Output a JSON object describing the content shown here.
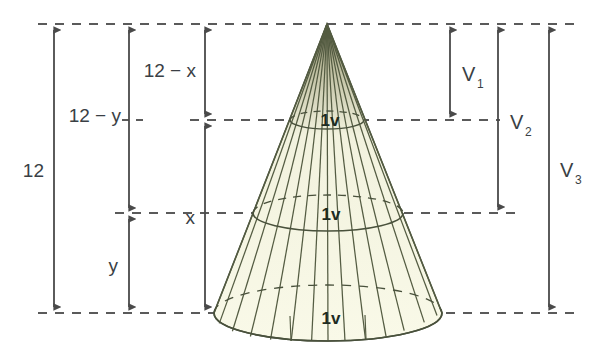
{
  "figure": {
    "background_color": "#ffffff",
    "line_color": "#4a4a4a",
    "cone_stroke_color": "#49513c",
    "cone_fill_color": "#f7f7e3",
    "cone_apex_color": "#3a3a2e",
    "text_color": "#3a3f45"
  },
  "dimensions": {
    "total": {
      "label": "12",
      "name": "total-height"
    },
    "upper_y": {
      "label": "12 − y",
      "name": "twelve-minus-y"
    },
    "lower_y": {
      "label": "y",
      "name": "y-segment"
    },
    "upper_x": {
      "label": "12 − x",
      "name": "twelve-minus-x"
    },
    "lower_x": {
      "label": "x",
      "name": "x-segment"
    }
  },
  "volumes": {
    "v1": {
      "label": "V",
      "sub": "1",
      "name": "volume-one"
    },
    "v2": {
      "label": "V",
      "sub": "2",
      "name": "volume-two"
    },
    "v3": {
      "label": "V",
      "sub": "3",
      "name": "volume-three"
    }
  },
  "slices": [
    {
      "label": "1v",
      "name": "slice-top"
    },
    {
      "label": "1v",
      "name": "slice-middle"
    },
    {
      "label": "1v",
      "name": "slice-bottom"
    }
  ],
  "guides": {
    "top_y": 24,
    "cut1_y": 120,
    "cut2_y": 213,
    "base_y": 313
  },
  "cone_geometry": {
    "apex_x": 327,
    "apex_y": 24,
    "base_center_x": 328,
    "base_rx": 114,
    "base_ry": 28,
    "cut1_rx": 37,
    "cut1_ry": 9,
    "cut2_rx": 75,
    "cut2_ry": 18,
    "meridian_count": 16
  }
}
